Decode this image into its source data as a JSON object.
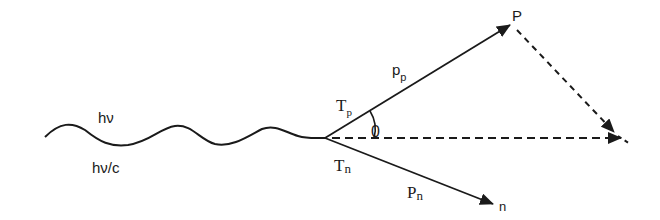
{
  "diagram": {
    "type": "vector-momentum-diagram",
    "colors": {
      "ink": "#1a1a1a",
      "background": "#ffffff",
      "bleed_through": "#d9d9d9"
    },
    "incident_photon": {
      "energy_label": "hν",
      "momentum_label": "hν/c"
    },
    "vertex": {
      "x": 325,
      "y": 138
    },
    "proton": {
      "kinetic_energy_label": {
        "main": "T",
        "sub": "p"
      },
      "momentum_label": {
        "main": "p",
        "sub": "p"
      },
      "endpoint_label": "P"
    },
    "neutron": {
      "kinetic_energy_label": {
        "main": "T",
        "sub": "n"
      },
      "momentum_label": {
        "main": "P",
        "sub": "n"
      },
      "endpoint_label": "n"
    },
    "angle_label": "0"
  }
}
